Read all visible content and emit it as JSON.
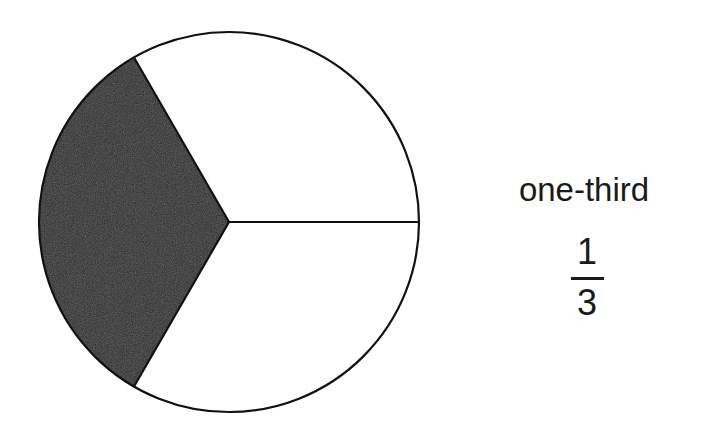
{
  "diagram": {
    "type": "fraction-circle",
    "total_parts": 3,
    "shaded_parts": 1,
    "shaded_color": "#2a2a2a",
    "unshaded_color": "#ffffff",
    "outline_color": "#111111"
  },
  "label": {
    "word": "one-third",
    "fraction": {
      "numerator": "1",
      "denominator": "3"
    }
  }
}
